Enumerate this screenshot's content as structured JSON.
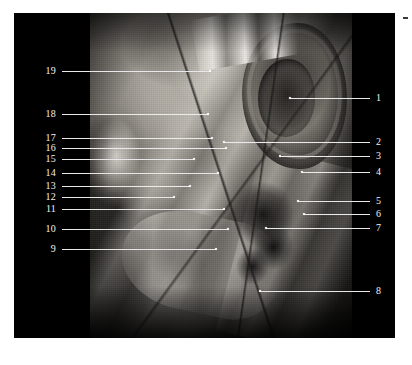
{
  "figure": {
    "name": "lateral-head-dissection-plate",
    "background_color": "#ffffff",
    "plate_color": "#000000",
    "label_color": "#f2f2f2",
    "leader_color": "#e9e9e9"
  },
  "corner_mark": {
    "name": "corner-tick",
    "color": "#3a3a3a"
  },
  "labels_left": [
    {
      "id": "19",
      "text": "19",
      "y": 58,
      "line_end_x": 196,
      "dot": true
    },
    {
      "id": "18",
      "text": "18",
      "y": 101,
      "line_end_x": 194,
      "dot": true
    },
    {
      "id": "17",
      "text": "17",
      "y": 125,
      "line_end_x": 198,
      "dot": true
    },
    {
      "id": "16",
      "text": "16",
      "y": 135,
      "line_end_x": 212,
      "dot": true
    },
    {
      "id": "15",
      "text": "15",
      "y": 146,
      "line_end_x": 180,
      "dot": true
    },
    {
      "id": "14",
      "text": "14",
      "y": 160,
      "line_end_x": 204,
      "dot": true
    },
    {
      "id": "13",
      "text": "13",
      "y": 173,
      "line_end_x": 176,
      "dot": true
    },
    {
      "id": "12",
      "text": "12",
      "y": 184,
      "line_end_x": 160,
      "dot": true
    },
    {
      "id": "11",
      "text": "11",
      "y": 196,
      "line_end_x": 210,
      "dot": true
    },
    {
      "id": "10",
      "text": "10",
      "y": 216,
      "line_end_x": 214,
      "dot": true
    },
    {
      "id": "9",
      "text": "9",
      "y": 236,
      "line_end_x": 202,
      "dot": true
    }
  ],
  "labels_right": [
    {
      "id": "1",
      "text": "1",
      "y": 85,
      "line_start_x": 276,
      "dot": true
    },
    {
      "id": "2",
      "text": "2",
      "y": 129,
      "line_start_x": 210,
      "dot": true
    },
    {
      "id": "3",
      "text": "3",
      "y": 143,
      "line_start_x": 266,
      "dot": true
    },
    {
      "id": "4",
      "text": "4",
      "y": 159,
      "line_start_x": 288,
      "dot": true
    },
    {
      "id": "5",
      "text": "5",
      "y": 188,
      "line_start_x": 284,
      "dot": true
    },
    {
      "id": "6",
      "text": "6",
      "y": 201,
      "line_start_x": 290,
      "dot": true
    },
    {
      "id": "7",
      "text": "7",
      "y": 215,
      "line_start_x": 252,
      "dot": true
    },
    {
      "id": "8",
      "text": "8",
      "y": 278,
      "line_start_x": 246,
      "dot": true
    }
  ]
}
